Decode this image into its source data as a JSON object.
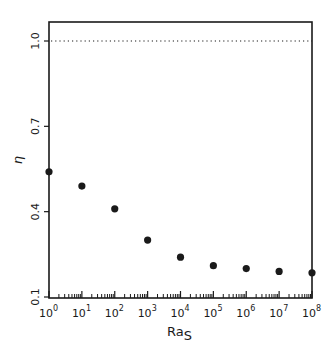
{
  "chart_data": {
    "type": "scatter",
    "title": "",
    "xlabel": "Ra",
    "xlabel_subscript": "S",
    "ylabel": "η",
    "xscale": "log",
    "xlim": [
      1,
      100000000
    ],
    "ylim": [
      0.1,
      1.05
    ],
    "x_ticks": [
      {
        "value": 1,
        "base": "10",
        "exp": "0"
      },
      {
        "value": 10,
        "base": "10",
        "exp": "1"
      },
      {
        "value": 100,
        "base": "10",
        "exp": "2"
      },
      {
        "value": 1000,
        "base": "10",
        "exp": "3"
      },
      {
        "value": 10000,
        "base": "10",
        "exp": "4"
      },
      {
        "value": 100000,
        "base": "10",
        "exp": "5"
      },
      {
        "value": 1000000,
        "base": "10",
        "exp": "6"
      },
      {
        "value": 10000000,
        "base": "10",
        "exp": "7"
      },
      {
        "value": 100000000,
        "base": "10",
        "exp": "8"
      }
    ],
    "y_ticks": [
      {
        "value": 0.1,
        "label": "0.1"
      },
      {
        "value": 0.4,
        "label": "0.4"
      },
      {
        "value": 0.7,
        "label": "0.7"
      },
      {
        "value": 1.0,
        "label": "1.0"
      }
    ],
    "reference_line": {
      "y": 1.0,
      "style": "dotted"
    },
    "grid": false,
    "legend": null,
    "x": [
      1,
      10,
      100,
      1000,
      10000,
      100000,
      1000000,
      10000000,
      100000000
    ],
    "series": [
      {
        "name": "η",
        "marker": "filled-circle",
        "values": [
          0.54,
          0.49,
          0.41,
          0.3,
          0.24,
          0.21,
          0.2,
          0.19,
          0.185
        ]
      }
    ]
  },
  "colors": {
    "ink": "#1a1a1a",
    "background": "#ffffff"
  }
}
